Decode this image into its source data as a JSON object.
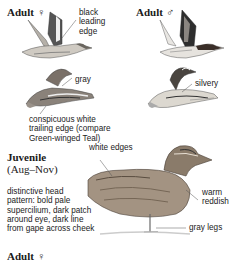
{
  "plates": [
    {
      "heading": "Adult",
      "sex_symbol": "♀",
      "annotations": [
        "black",
        "leading",
        "edge"
      ]
    },
    {
      "heading": "Adult",
      "sex_symbol": "♂"
    },
    {
      "annotations": [
        "gray"
      ]
    },
    {
      "annotations": [
        "silvery"
      ]
    }
  ],
  "flight_caption": [
    "conspicuous white",
    "trailing edge (compare",
    "Green-winged Teal)"
  ],
  "juvenile": {
    "heading": "Juvenile",
    "season": "(Aug–Nov)",
    "description": [
      "distinctive head",
      "pattern: bold pale",
      "supercilium, dark patch",
      "around eye, dark line",
      "from gape across cheek"
    ],
    "callouts": {
      "white_edges": "white edges",
      "warm_reddish": [
        "warm",
        "reddish"
      ],
      "gray_legs": "gray legs"
    }
  },
  "next_section": {
    "heading": "Adult",
    "sex_symbol": "♀"
  },
  "colors": {
    "ink": "#1a1a1a",
    "plumage_dark": "#3a3a3a",
    "plumage_mid": "#8a8580",
    "plumage_light": "#d8d4cc",
    "juvenile_body": "#9a8a78"
  }
}
